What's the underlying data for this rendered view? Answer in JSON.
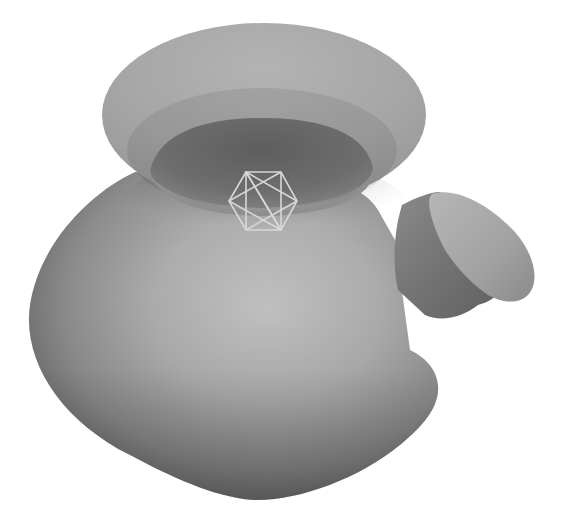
{
  "scene": {
    "subject": "3D rendered vase with spout",
    "background_color": "#ffffff",
    "gizmo": {
      "icon": "hexagram-empty-marker",
      "stroke_color": "#d6d6d6",
      "vertices": {
        "top_left": [
          246,
          172
        ],
        "top_right": [
          281,
          172
        ],
        "left": [
          229,
          201
        ],
        "right": [
          297,
          201
        ],
        "bottom_left": [
          246,
          230
        ],
        "bottom_right": [
          281,
          230
        ]
      }
    },
    "colors": {
      "rim_top": "#a9a9a9",
      "rim_edge": "#9a9a9a",
      "neck_interior": "#6c6c6c",
      "neck_lip": "#8e8e8e",
      "body_highlight": "#c2c2c2",
      "body_mid": "#9c9c9c",
      "body_shadow": "#6a6a6a",
      "spout_cap": "#a8a8a8",
      "spout_side": "#777777"
    },
    "shapes": {
      "rim": {
        "cx": 264,
        "cy": 115,
        "rx": 162,
        "ry": 92
      },
      "neck_opening": {
        "cx": 261,
        "cy": 168,
        "rx": 112,
        "ry": 42
      },
      "body_bottom_y": 500,
      "body_left_x": 28
    }
  }
}
